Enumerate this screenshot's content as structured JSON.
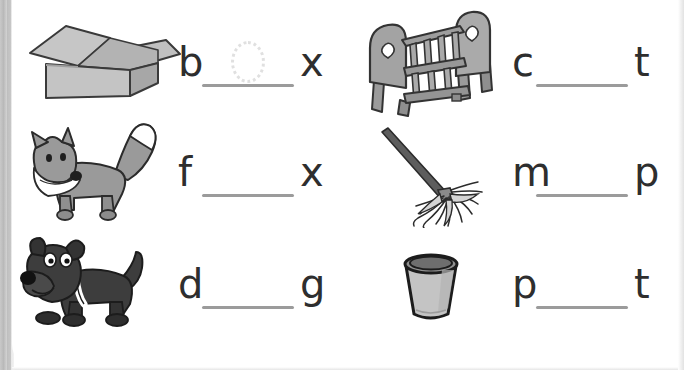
{
  "worksheet": {
    "title": "CVC word building worksheet",
    "colors": {
      "ink": "#2e2e2e",
      "blank_line": "#9b9b9b",
      "art_mid_gray": "#9a9a9a",
      "art_light_gray": "#c4c4c4",
      "art_dark_gray": "#4a4a4a",
      "trace_hint": "#e0e0e0",
      "page": "#ffffff"
    },
    "items": [
      {
        "id": "item-box",
        "picture": "open-cardboard-box",
        "first_letter": "b",
        "last_letter": "x",
        "blank": "",
        "trace_hint": "o",
        "answer": "box"
      },
      {
        "id": "item-cot",
        "picture": "baby-cot-crib",
        "first_letter": "c",
        "last_letter": "t",
        "blank": "",
        "trace_hint": "",
        "answer": "cot"
      },
      {
        "id": "item-fox",
        "picture": "fox",
        "first_letter": "f",
        "last_letter": "x",
        "blank": "",
        "trace_hint": "",
        "answer": "fox"
      },
      {
        "id": "item-mop",
        "picture": "mop",
        "first_letter": "m",
        "last_letter": "p",
        "blank": "",
        "trace_hint": "",
        "answer": "mop"
      },
      {
        "id": "item-dog",
        "picture": "dog",
        "first_letter": "d",
        "last_letter": "g",
        "blank": "",
        "trace_hint": "",
        "answer": "dog"
      },
      {
        "id": "item-pot",
        "picture": "pot",
        "first_letter": "p",
        "last_letter": "t",
        "blank": "",
        "trace_hint": "",
        "answer": "pot"
      }
    ]
  }
}
